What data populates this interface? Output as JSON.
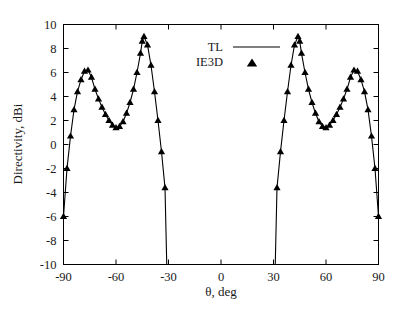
{
  "figure": {
    "background_color": "#ffffff",
    "foreground_color": "#000000",
    "top_cropped_text": ""
  },
  "chart_data": {
    "type": "line",
    "title": "",
    "subtitle": "",
    "xlabel": "θ, deg",
    "ylabel": "Directivity, dBi",
    "xlim": [
      -90,
      90
    ],
    "ylim": [
      -10,
      10
    ],
    "xticks": [
      -90,
      -60,
      -30,
      0,
      30,
      60,
      90
    ],
    "xtick_labels": [
      "-90",
      "-60",
      "-30",
      "0",
      "30",
      "60",
      "90"
    ],
    "yticks": [
      -10,
      -8,
      -6,
      -4,
      -2,
      0,
      2,
      4,
      6,
      8,
      10
    ],
    "ytick_labels": [
      "-10",
      "-8",
      "-6",
      "-4",
      "-2",
      "0",
      "2",
      "4",
      "6",
      "8",
      "10"
    ],
    "grid": false,
    "legend_position": "upper-center",
    "legend": [
      {
        "name": "TL",
        "style": "line",
        "color": "#000000"
      },
      {
        "name": "IE3D",
        "style": "marker",
        "marker": "triangle-up",
        "color": "#000000"
      }
    ],
    "series": [
      {
        "name": "TL",
        "style": "line",
        "color": "#000000",
        "x": [
          -90,
          -88,
          -86,
          -84,
          -82,
          -80,
          -78,
          -76,
          -74,
          -72,
          -70,
          -68,
          -66,
          -64,
          -62,
          -60,
          -58,
          -56,
          -54,
          -52,
          -50,
          -48,
          -46,
          -45,
          -44,
          -42,
          -40,
          -38,
          -36,
          -34,
          -32,
          -31,
          31,
          32,
          34,
          36,
          38,
          40,
          42,
          44,
          45,
          46,
          48,
          50,
          52,
          54,
          56,
          58,
          60,
          62,
          64,
          66,
          68,
          70,
          72,
          74,
          76,
          78,
          80,
          82,
          84,
          86,
          88,
          90
        ],
        "y": [
          -6.0,
          -2.0,
          0.7,
          2.9,
          4.4,
          5.4,
          6.1,
          6.2,
          5.6,
          4.6,
          3.8,
          3.1,
          2.5,
          2.0,
          1.6,
          1.4,
          1.5,
          1.9,
          2.6,
          3.5,
          4.6,
          6.0,
          7.6,
          8.6,
          9.0,
          8.3,
          6.6,
          4.4,
          2.0,
          -0.6,
          -3.6,
          -10.0,
          -10.0,
          -3.6,
          -0.6,
          2.0,
          4.4,
          6.6,
          8.3,
          9.0,
          8.6,
          7.6,
          6.0,
          4.6,
          3.5,
          2.6,
          1.9,
          1.5,
          1.4,
          1.6,
          2.0,
          2.5,
          3.1,
          3.8,
          4.6,
          5.6,
          6.2,
          6.1,
          5.4,
          4.4,
          2.9,
          0.7,
          -2.0,
          -6.0
        ]
      },
      {
        "name": "IE3D",
        "style": "marker",
        "marker": "triangle-up",
        "color": "#000000",
        "x": [
          -90,
          -88,
          -86,
          -84,
          -82,
          -80,
          -78,
          -76,
          -74,
          -72,
          -70,
          -68,
          -66,
          -64,
          -62,
          -60,
          -58,
          -56,
          -54,
          -52,
          -50,
          -48,
          -46,
          -45,
          -44,
          -42,
          -40,
          -38,
          -36,
          -34,
          -32,
          32,
          34,
          36,
          38,
          40,
          42,
          44,
          45,
          46,
          48,
          50,
          52,
          54,
          56,
          58,
          60,
          62,
          64,
          66,
          68,
          70,
          72,
          74,
          76,
          78,
          80,
          82,
          84,
          86,
          88,
          90
        ],
        "y": [
          -6.0,
          -2.0,
          0.7,
          2.9,
          4.4,
          5.4,
          6.1,
          6.2,
          5.6,
          4.6,
          3.8,
          3.1,
          2.5,
          2.0,
          1.6,
          1.4,
          1.5,
          1.9,
          2.6,
          3.5,
          4.6,
          6.0,
          7.6,
          8.6,
          9.0,
          8.3,
          6.6,
          4.4,
          2.0,
          -0.6,
          -3.6,
          -3.6,
          -0.6,
          2.0,
          4.4,
          6.6,
          8.3,
          9.0,
          8.6,
          7.6,
          6.0,
          4.6,
          3.5,
          2.6,
          1.9,
          1.5,
          1.4,
          1.6,
          2.0,
          2.5,
          3.1,
          3.8,
          4.6,
          5.6,
          6.2,
          6.1,
          5.4,
          4.4,
          2.9,
          0.7,
          -2.0,
          -6.0
        ]
      }
    ]
  }
}
